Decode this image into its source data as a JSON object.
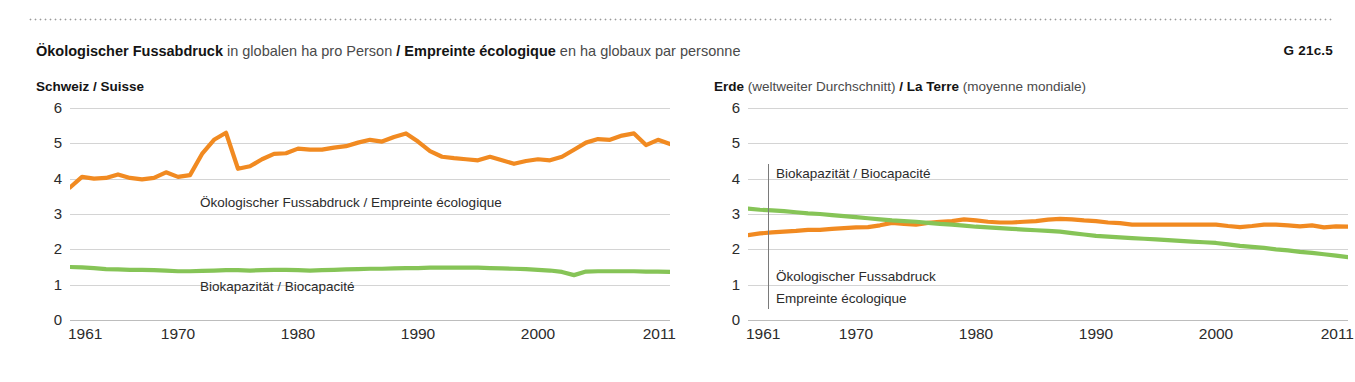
{
  "header": {
    "title_de_bold": "Ökologischer Fussabdruck",
    "title_de_rest": " in globalen ha pro Person ",
    "separator": "/ ",
    "title_fr_bold": "Empreinte écologique",
    "title_fr_rest": " en ha globaux par personne",
    "figure_number": "G 21c.5"
  },
  "colors": {
    "footprint": "#F18A21",
    "biocapacity": "#86C457",
    "grid": "#d4d4d4",
    "text": "#2b2b2b"
  },
  "panels": [
    {
      "id": "switzerland",
      "subtitle_bold_1": "Schweiz",
      "subtitle_sep": " / ",
      "subtitle_bold_2": "Suisse",
      "annotations": [
        {
          "name": "footprint-label",
          "text": "Ökologischer Fussabdruck / Empreinte écologique"
        },
        {
          "name": "biocapacity-label",
          "text": "Biokapazität / Biocapacité"
        }
      ]
    },
    {
      "id": "world",
      "subtitle_bold_1": "Erde",
      "subtitle_reg_1": " (weltweiter Durchschnitt) ",
      "subtitle_sep": "/ ",
      "subtitle_bold_2": "La Terre",
      "subtitle_reg_2": " (moyenne mondiale)",
      "annotations": [
        {
          "name": "biocapacity-label",
          "text": "Biokapazität / Biocapacité"
        },
        {
          "name": "footprint-label-line1",
          "text": "Ökologischer Fussabdruck"
        },
        {
          "name": "footprint-label-line2",
          "text": "Empreinte écologique"
        }
      ]
    }
  ],
  "chart_data": [
    {
      "type": "line",
      "title": "Ökologischer Fussabdruck in globalen ha pro Person / Empreinte écologique en ha globaux par personne",
      "subtitle": "Schweiz / Suisse",
      "xlabel": "",
      "ylabel": "",
      "xlim": [
        1961,
        2011
      ],
      "ylim": [
        0,
        6
      ],
      "yticks": [
        0,
        1,
        2,
        3,
        4,
        5,
        6
      ],
      "xticks": [
        1961,
        1970,
        1980,
        1990,
        2000,
        2011
      ],
      "grid": true,
      "legend": "inline-annotations",
      "x": [
        1961,
        1962,
        1963,
        1964,
        1965,
        1966,
        1967,
        1968,
        1969,
        1970,
        1971,
        1972,
        1973,
        1974,
        1975,
        1976,
        1977,
        1978,
        1979,
        1980,
        1981,
        1982,
        1983,
        1984,
        1985,
        1986,
        1987,
        1988,
        1989,
        1990,
        1991,
        1992,
        1993,
        1994,
        1995,
        1996,
        1997,
        1998,
        1999,
        2000,
        2001,
        2002,
        2003,
        2004,
        2005,
        2006,
        2007,
        2008,
        2009,
        2010,
        2011
      ],
      "series": [
        {
          "name": "Ökologischer Fussabdruck / Empreinte écologique",
          "color": "#F18A21",
          "values": [
            3.75,
            4.05,
            4.0,
            4.02,
            4.12,
            4.02,
            3.98,
            4.02,
            4.18,
            4.05,
            4.1,
            4.7,
            5.1,
            5.3,
            4.28,
            4.35,
            4.55,
            4.7,
            4.72,
            4.85,
            4.82,
            4.82,
            4.88,
            4.92,
            5.02,
            5.1,
            5.05,
            5.18,
            5.28,
            5.05,
            4.78,
            4.62,
            4.58,
            4.55,
            4.52,
            4.62,
            4.52,
            4.42,
            4.5,
            4.55,
            4.52,
            4.62,
            4.82,
            5.02,
            5.12,
            5.1,
            5.22,
            5.28,
            4.95,
            5.1,
            4.98
          ]
        },
        {
          "name": "Biokapazität / Biocapacité",
          "color": "#86C457",
          "values": [
            1.5,
            1.49,
            1.47,
            1.44,
            1.43,
            1.42,
            1.42,
            1.41,
            1.4,
            1.38,
            1.38,
            1.39,
            1.4,
            1.41,
            1.41,
            1.4,
            1.41,
            1.42,
            1.42,
            1.41,
            1.4,
            1.41,
            1.42,
            1.43,
            1.44,
            1.45,
            1.45,
            1.46,
            1.47,
            1.47,
            1.48,
            1.48,
            1.48,
            1.48,
            1.48,
            1.47,
            1.46,
            1.45,
            1.44,
            1.42,
            1.4,
            1.36,
            1.27,
            1.37,
            1.38,
            1.38,
            1.38,
            1.38,
            1.37,
            1.37,
            1.36
          ]
        }
      ]
    },
    {
      "type": "line",
      "title": "Ökologischer Fussabdruck in globalen ha pro Person / Empreinte écologique en ha globaux par personne",
      "subtitle": "Erde (weltweiter Durchschnitt) / La Terre (moyenne mondiale)",
      "xlabel": "",
      "ylabel": "",
      "xlim": [
        1961,
        2011
      ],
      "ylim": [
        0,
        6
      ],
      "yticks": [
        0,
        1,
        2,
        3,
        4,
        5,
        6
      ],
      "xticks": [
        1961,
        1970,
        1980,
        1990,
        2000,
        2011
      ],
      "grid": true,
      "legend": "inline-annotations",
      "x": [
        1961,
        1962,
        1963,
        1964,
        1965,
        1966,
        1967,
        1968,
        1969,
        1970,
        1971,
        1972,
        1973,
        1974,
        1975,
        1976,
        1977,
        1978,
        1979,
        1980,
        1981,
        1982,
        1983,
        1984,
        1985,
        1986,
        1987,
        1988,
        1989,
        1990,
        1991,
        1992,
        1993,
        1994,
        1995,
        1996,
        1997,
        1998,
        1999,
        2000,
        2001,
        2002,
        2003,
        2004,
        2005,
        2006,
        2007,
        2008,
        2009,
        2010,
        2011
      ],
      "series": [
        {
          "name": "Ökologischer Fussabdruck / Empreinte écologique",
          "color": "#F18A21",
          "values": [
            2.4,
            2.45,
            2.48,
            2.5,
            2.52,
            2.55,
            2.55,
            2.58,
            2.6,
            2.62,
            2.63,
            2.68,
            2.75,
            2.72,
            2.7,
            2.75,
            2.78,
            2.8,
            2.85,
            2.82,
            2.78,
            2.76,
            2.76,
            2.78,
            2.8,
            2.84,
            2.86,
            2.85,
            2.82,
            2.8,
            2.76,
            2.74,
            2.7,
            2.7,
            2.7,
            2.7,
            2.7,
            2.7,
            2.7,
            2.7,
            2.66,
            2.63,
            2.66,
            2.7,
            2.7,
            2.68,
            2.65,
            2.68,
            2.62,
            2.65,
            2.64
          ]
        },
        {
          "name": "Biokapazität / Biocapacité",
          "color": "#86C457",
          "values": [
            3.15,
            3.12,
            3.1,
            3.08,
            3.05,
            3.02,
            3.0,
            2.97,
            2.94,
            2.91,
            2.88,
            2.85,
            2.82,
            2.8,
            2.78,
            2.75,
            2.72,
            2.7,
            2.67,
            2.64,
            2.62,
            2.6,
            2.58,
            2.56,
            2.54,
            2.52,
            2.5,
            2.46,
            2.42,
            2.38,
            2.36,
            2.34,
            2.32,
            2.3,
            2.28,
            2.26,
            2.24,
            2.22,
            2.2,
            2.18,
            2.14,
            2.1,
            2.07,
            2.04,
            2.0,
            1.97,
            1.93,
            1.9,
            1.86,
            1.82,
            1.78
          ]
        }
      ]
    }
  ]
}
